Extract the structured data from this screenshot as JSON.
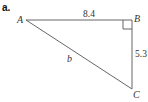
{
  "part_label": "a.",
  "figure": {
    "type": "right-triangle",
    "vertices": {
      "A": "A",
      "B": "B",
      "C": "C"
    },
    "right_angle_at": "B",
    "sides": {
      "AB": "8.4",
      "BC": "5.3",
      "AC": "b"
    },
    "line_color": "#555555"
  }
}
